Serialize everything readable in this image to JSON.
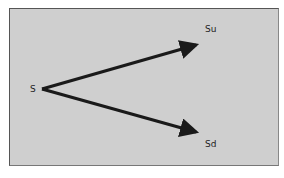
{
  "diagram": {
    "type": "binomial-tree-one-step",
    "nodes": [
      {
        "id": "root",
        "label": "S"
      },
      {
        "id": "up",
        "label": "Su"
      },
      {
        "id": "down",
        "label": "Sd"
      }
    ],
    "edges": [
      {
        "from": "root",
        "to": "up"
      },
      {
        "from": "root",
        "to": "down"
      }
    ],
    "colors": {
      "background": "#cfcfcf",
      "border": "#555555",
      "arrow": "#1a1a1a",
      "text": "#222222"
    }
  }
}
